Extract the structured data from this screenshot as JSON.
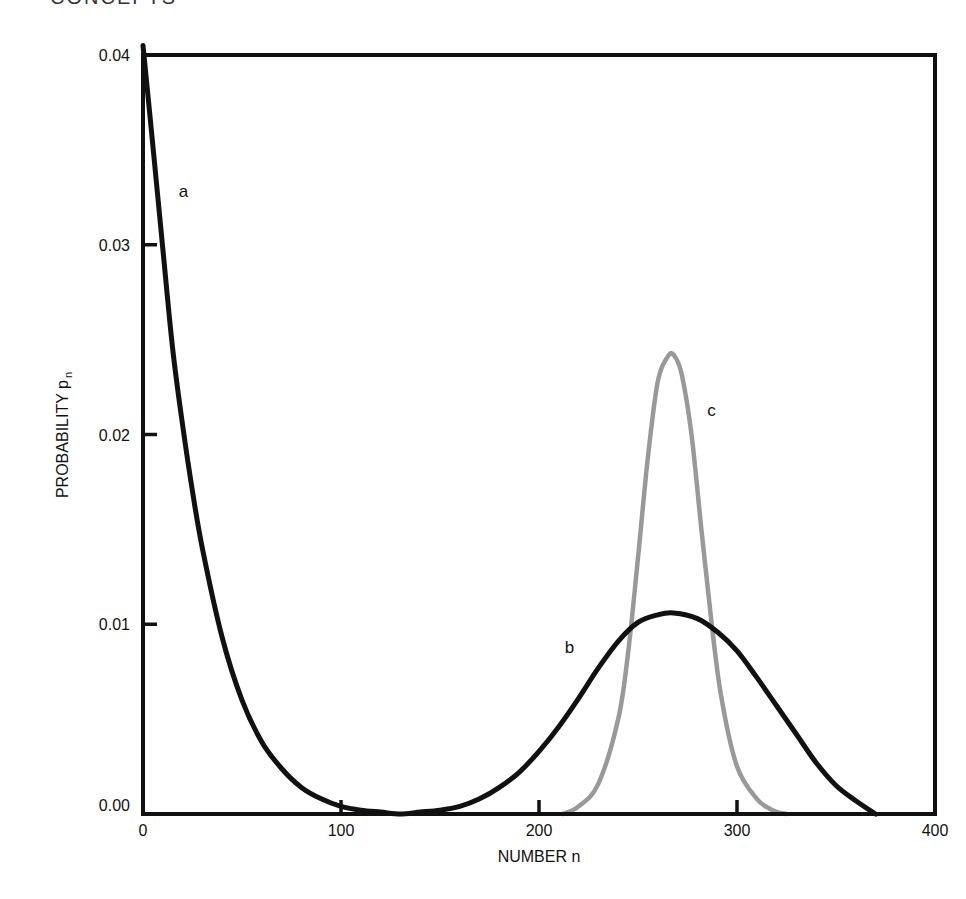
{
  "header": {
    "cut_off_title": "CONCEPTS"
  },
  "chart_data": {
    "type": "line",
    "title": "",
    "xlabel": "NUMBER n",
    "ylabel": "PROBABILITY p",
    "ylabel_subscript": "n",
    "xlim": [
      0,
      400
    ],
    "ylim": [
      0.0,
      0.04
    ],
    "x_ticks": [
      0,
      100,
      200,
      300,
      400
    ],
    "x_tick_labels": [
      "0",
      "100",
      "200",
      "300",
      "400"
    ],
    "y_ticks": [
      0.0,
      0.01,
      0.02,
      0.03,
      0.04
    ],
    "y_tick_labels": [
      "0.00",
      "0.01",
      "0.02",
      "0.03",
      "0.04"
    ],
    "grid": false,
    "legend": "inline curve labels",
    "series": [
      {
        "name": "a",
        "color": "#111111",
        "x": [
          0,
          5,
          10,
          15,
          20,
          25,
          30,
          40,
          50,
          60,
          70,
          80,
          90,
          100,
          110,
          120,
          130,
          140,
          150,
          160,
          170,
          180,
          190,
          200,
          210,
          220,
          230,
          240,
          250,
          260,
          268,
          280,
          290,
          300,
          310,
          320,
          330,
          340,
          350,
          360,
          370
        ],
        "y": [
          0.0405,
          0.0352,
          0.0298,
          0.0245,
          0.0205,
          0.017,
          0.014,
          0.0093,
          0.006,
          0.0038,
          0.0024,
          0.0014,
          0.0008,
          0.0004,
          0.0002,
          0.0001,
          0.0,
          0.0001,
          0.0002,
          0.0004,
          0.0008,
          0.0014,
          0.0022,
          0.0033,
          0.0046,
          0.0061,
          0.0077,
          0.0091,
          0.0101,
          0.0105,
          0.0106,
          0.0103,
          0.0096,
          0.0086,
          0.0072,
          0.0057,
          0.0042,
          0.0027,
          0.0015,
          0.0007,
          0.0
        ]
      },
      {
        "name": "b",
        "color": "#111111",
        "x": [
          130,
          150,
          170,
          180,
          190,
          200,
          210,
          220,
          230,
          240,
          250,
          260,
          268,
          280,
          290,
          300,
          310,
          320,
          330,
          340,
          350,
          360,
          370
        ],
        "y": [
          0.0,
          0.0002,
          0.0004,
          0.0008,
          0.0014,
          0.0022,
          0.0033,
          0.0046,
          0.0061,
          0.0077,
          0.0091,
          0.0101,
          0.0105,
          0.0103,
          0.0096,
          0.0086,
          0.0072,
          0.0057,
          0.0042,
          0.0027,
          0.0015,
          0.0007,
          0.0
        ]
      },
      {
        "name": "c",
        "color": "#999999",
        "x": [
          212,
          220,
          230,
          240,
          245,
          250,
          255,
          260,
          265,
          268,
          272,
          277,
          282,
          287,
          292,
          300,
          310,
          318,
          325
        ],
        "y": [
          0.0,
          0.0004,
          0.0016,
          0.005,
          0.0085,
          0.0135,
          0.0188,
          0.0228,
          0.0241,
          0.0242,
          0.0232,
          0.02,
          0.015,
          0.0102,
          0.0062,
          0.0025,
          0.0008,
          0.0002,
          0.0
        ]
      }
    ],
    "annotations": [
      {
        "text": "a",
        "x": 18,
        "y": 0.0325
      },
      {
        "text": "b",
        "x": 213,
        "y": 0.0085
      },
      {
        "text": "c",
        "x": 285,
        "y": 0.021
      }
    ]
  }
}
